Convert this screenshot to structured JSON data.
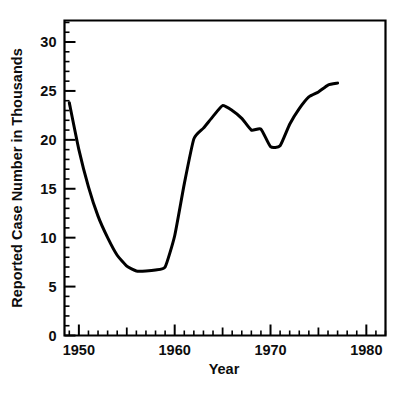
{
  "chart_data": {
    "type": "line",
    "title": "",
    "xlabel": "Year",
    "ylabel": "Reported Case Number in Thousands",
    "xlim": [
      1948.5,
      1982.0
    ],
    "ylim": [
      0,
      32.2
    ],
    "grid": false,
    "legend": null,
    "x_ticks_major": [
      1950,
      1960,
      1970,
      1980
    ],
    "x_tick_labels": [
      "1950",
      "1960",
      "1970",
      "1980"
    ],
    "x_ticks_mid": [
      1955,
      1965,
      1975
    ],
    "x_tick_minor_step": 1,
    "y_ticks_major": [
      0,
      5,
      10,
      15,
      20,
      25,
      30
    ],
    "y_tick_labels": [
      "0",
      "5",
      "10",
      "15",
      "20",
      "25",
      "30"
    ],
    "y_tick_minor_step": 1,
    "series": [
      {
        "name": "Reported cases",
        "x": [
          1949,
          1950,
          1951,
          1952,
          1953,
          1954,
          1955,
          1956,
          1957,
          1958,
          1959,
          1960,
          1961,
          1962,
          1963,
          1964,
          1965,
          1966,
          1967,
          1968,
          1969,
          1970,
          1971,
          1972,
          1973,
          1974,
          1975,
          1976,
          1977
        ],
        "values": [
          23.8,
          19.0,
          15.2,
          12.2,
          10.0,
          8.2,
          7.1,
          6.6,
          6.6,
          6.7,
          7.0,
          10.2,
          15.5,
          20.1,
          21.2,
          22.4,
          23.5,
          23.0,
          22.2,
          21.0,
          21.1,
          19.3,
          19.4,
          21.6,
          23.2,
          24.4,
          24.9,
          25.6,
          25.8
        ],
        "color": "#000000"
      }
    ]
  },
  "axes": {
    "x_axis_name": "Year",
    "y_axis_name": "Reported Case Number in Thousands"
  }
}
